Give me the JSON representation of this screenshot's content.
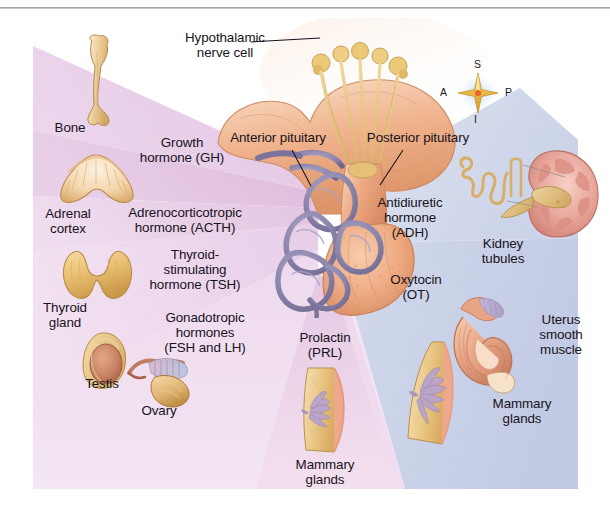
{
  "figure": {
    "compass": {
      "superior": "S",
      "inferior": "I",
      "anterior": "A",
      "posterior": "P"
    },
    "center_labels": [
      {
        "id": "hypothalamic-nerve-cell",
        "text": "Hypothalamic\nnerve cell"
      },
      {
        "id": "anterior-pituitary",
        "text": "Anterior pituitary"
      },
      {
        "id": "posterior-pituitary",
        "text": "Posterior pituitary"
      }
    ],
    "anterior_hormones": [
      {
        "id": "growth-hormone",
        "name": "Growth\nhormone (GH)",
        "target": "Bone"
      },
      {
        "id": "acth",
        "name": "Adrenocorticotropic\nhormone (ACTH)",
        "target": "Adrenal\ncortex"
      },
      {
        "id": "tsh",
        "name": "Thyroid-\nstimulating\nhormone (TSH)",
        "target": "Thyroid\ngland"
      },
      {
        "id": "gonadotropic",
        "name": "Gonadotropic\nhormones\n(FSH and LH)",
        "target": "Testis",
        "target2": "Ovary"
      },
      {
        "id": "prolactin",
        "name": "Prolactin\n(PRL)",
        "target": "Mammary\nglands"
      }
    ],
    "posterior_hormones": [
      {
        "id": "adh",
        "name": "Antidiuretic\nhormone\n(ADH)",
        "target": "Kidney\ntubules"
      },
      {
        "id": "oxytocin",
        "name": "Oxytocin\n(OT)",
        "target": "Uterus\nsmooth\nmuscle",
        "target2": "Mammary\nglands"
      }
    ],
    "colors": {
      "wedge_pink_light": "#ecd9ec",
      "wedge_pink_mid": "#e6c9e4",
      "wedge_pink_deep": "#ddb9dc",
      "wedge_pink_pale": "#f0dced",
      "wedge_blue_light": "#d6dcee",
      "wedge_blue_mid": "#c6cfe6",
      "background": "#ffffff",
      "text": "#17131c",
      "rule": "#9a9a9a",
      "tissue_tan": "#e8b77e",
      "tissue_flesh": "#eead8e",
      "vessel_purple": "#8b87ac"
    }
  }
}
